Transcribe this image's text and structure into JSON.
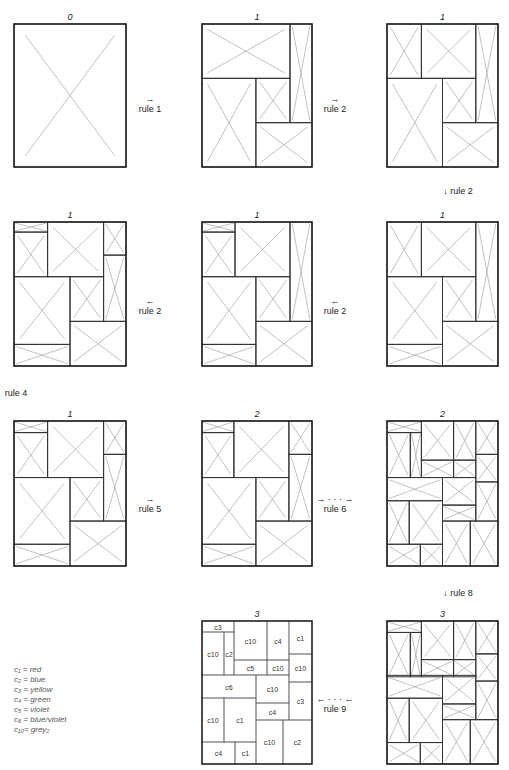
{
  "panels": [
    {
      "id": "p0",
      "label": "0",
      "x": 14,
      "y": 24,
      "w": 112,
      "h": 143
    },
    {
      "id": "p1",
      "label": "1",
      "x": 202,
      "y": 24,
      "w": 110,
      "h": 143
    },
    {
      "id": "p2",
      "label": "1",
      "x": 387,
      "y": 24,
      "w": 111,
      "h": 143
    },
    {
      "id": "p3",
      "label": "1",
      "x": 14,
      "y": 222,
      "w": 112,
      "h": 144
    },
    {
      "id": "p4",
      "label": "1",
      "x": 202,
      "y": 222,
      "w": 110,
      "h": 144
    },
    {
      "id": "p5",
      "label": "1",
      "x": 387,
      "y": 222,
      "w": 111,
      "h": 144
    },
    {
      "id": "p6",
      "label": "1",
      "x": 14,
      "y": 421,
      "w": 112,
      "h": 145
    },
    {
      "id": "p7",
      "label": "2",
      "x": 202,
      "y": 421,
      "w": 110,
      "h": 145
    },
    {
      "id": "p8",
      "label": "2",
      "x": 387,
      "y": 421,
      "w": 111,
      "h": 145
    },
    {
      "id": "p9",
      "label": "3",
      "x": 202,
      "y": 621,
      "w": 110,
      "h": 143
    },
    {
      "id": "p10",
      "label": "3",
      "x": 387,
      "y": 621,
      "w": 111,
      "h": 143
    }
  ],
  "rules": [
    {
      "text": "rule 1",
      "arrow": "→",
      "x": 150,
      "y": 94
    },
    {
      "text": "rule 2",
      "arrow": "→",
      "x": 335,
      "y": 94
    },
    {
      "text": "↓ rule 2",
      "x": 458,
      "y": 186
    },
    {
      "text": "rule 2",
      "arrow": "←",
      "x": 150,
      "y": 296
    },
    {
      "text": "rule 2",
      "arrow": "←",
      "x": 335,
      "y": 296
    },
    {
      "text": "rule 4",
      "x": 16,
      "y": 388
    },
    {
      "text": "rule 5",
      "arrow": "→",
      "x": 150,
      "y": 494
    },
    {
      "text": "rule 6",
      "arrow": "→ · · · →",
      "x": 335,
      "y": 494
    },
    {
      "text": "↓ rule 8",
      "x": 458,
      "y": 588
    },
    {
      "text": "rule 9",
      "arrow": "← · · · ←",
      "x": 335,
      "y": 694
    }
  ],
  "legend": [
    "c₁ = red",
    "c₂ = blue",
    "c₃ = yellow",
    "c₄ = green",
    "c₅ = violet",
    "c₆ = blue/violet",
    "c₁₀= grey₂"
  ],
  "colored_cells": [
    {
      "label": "c3",
      "x": 0,
      "y": 0,
      "w": 32,
      "h": 11
    },
    {
      "label": "c10",
      "x": 0,
      "y": 11,
      "w": 22,
      "h": 43
    },
    {
      "label": "c2",
      "x": 22,
      "y": 11,
      "w": 10,
      "h": 43
    },
    {
      "label": "c10",
      "x": 32,
      "y": 0,
      "w": 33,
      "h": 39
    },
    {
      "label": "c4",
      "x": 65,
      "y": 0,
      "w": 22,
      "h": 39
    },
    {
      "label": "c5",
      "x": 32,
      "y": 39,
      "w": 33,
      "h": 15
    },
    {
      "label": "c10",
      "x": 65,
      "y": 39,
      "w": 22,
      "h": 15
    },
    {
      "label": "c1",
      "x": 87,
      "y": 0,
      "w": 23,
      "h": 33
    },
    {
      "label": "c10",
      "x": 87,
      "y": 33,
      "w": 23,
      "h": 28
    },
    {
      "label": "c3",
      "x": 87,
      "y": 61,
      "w": 23,
      "h": 38
    },
    {
      "label": "c6",
      "x": 0,
      "y": 54,
      "w": 54,
      "h": 23
    },
    {
      "label": "c10",
      "x": 0,
      "y": 77,
      "w": 22,
      "h": 44
    },
    {
      "label": "c1",
      "x": 22,
      "y": 77,
      "w": 32,
      "h": 44
    },
    {
      "label": "c10",
      "x": 54,
      "y": 54,
      "w": 33,
      "h": 28
    },
    {
      "label": "c4",
      "x": 54,
      "y": 82,
      "w": 33,
      "h": 17
    },
    {
      "label": "c10",
      "x": 54,
      "y": 99,
      "w": 27,
      "h": 44
    },
    {
      "label": "c2",
      "x": 81,
      "y": 99,
      "w": 29,
      "h": 44
    },
    {
      "label": "c4",
      "x": 0,
      "y": 121,
      "w": 33,
      "h": 22
    },
    {
      "label": "c1",
      "x": 33,
      "y": 121,
      "w": 21,
      "h": 22
    }
  ]
}
